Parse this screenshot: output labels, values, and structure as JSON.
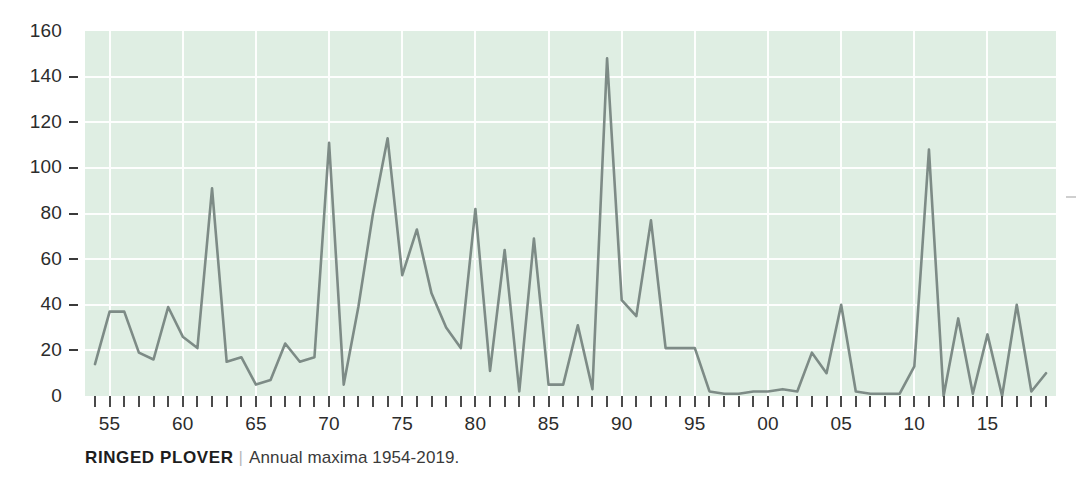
{
  "caption": {
    "species": "RINGED PLOVER",
    "separator": "|",
    "subtitle": "Annual maxima 1954-2019."
  },
  "colors": {
    "plot_background": "#dfeee3",
    "gridline": "#fdfefd",
    "line": "#7d8b86",
    "axis_text": "#2c2c2c",
    "caption_species": "#1d1d1d",
    "caption_separator": "#b9b9b9"
  },
  "chart_data": {
    "type": "line",
    "title": "RINGED PLOVER",
    "subtitle": "Annual maxima 1954-2019.",
    "xlabel": "",
    "ylabel": "",
    "xlim": [
      1954,
      2019
    ],
    "ylim": [
      0,
      160
    ],
    "grid": true,
    "legend": "none",
    "y_ticks": [
      0,
      20,
      40,
      60,
      80,
      100,
      120,
      140,
      160
    ],
    "y_tick_labels": [
      "0",
      "20",
      "40",
      "60",
      "80",
      "100",
      "120",
      "140",
      "160"
    ],
    "x_ticks": [
      1955,
      1960,
      1965,
      1970,
      1975,
      1980,
      1985,
      1990,
      1995,
      2000,
      2005,
      2010,
      2015
    ],
    "x_tick_labels": [
      "55",
      "60",
      "65",
      "70",
      "75",
      "80",
      "85",
      "90",
      "95",
      "00",
      "05",
      "10",
      "15"
    ],
    "x": [
      1954,
      1955,
      1956,
      1957,
      1958,
      1959,
      1960,
      1961,
      1962,
      1963,
      1964,
      1965,
      1966,
      1967,
      1968,
      1969,
      1970,
      1971,
      1972,
      1973,
      1974,
      1975,
      1976,
      1977,
      1978,
      1979,
      1980,
      1981,
      1982,
      1983,
      1984,
      1985,
      1986,
      1987,
      1988,
      1989,
      1990,
      1991,
      1992,
      1993,
      1994,
      1995,
      1996,
      1997,
      1998,
      1999,
      2000,
      2001,
      2002,
      2003,
      2004,
      2005,
      2006,
      2007,
      2008,
      2009,
      2010,
      2011,
      2012,
      2013,
      2014,
      2015,
      2016,
      2017,
      2018,
      2019
    ],
    "values": [
      14,
      37,
      37,
      19,
      16,
      39,
      26,
      21,
      91,
      15,
      17,
      5,
      7,
      23,
      15,
      17,
      111,
      5,
      39,
      80,
      113,
      53,
      73,
      45,
      30,
      21,
      82,
      11,
      64,
      2,
      69,
      5,
      5,
      31,
      3,
      148,
      42,
      35,
      77,
      21,
      21,
      21,
      2,
      1,
      1,
      2,
      2,
      3,
      2,
      19,
      10,
      40,
      2,
      1,
      1,
      1,
      13,
      108,
      0,
      34,
      1,
      27,
      0,
      40,
      2,
      10
    ]
  }
}
